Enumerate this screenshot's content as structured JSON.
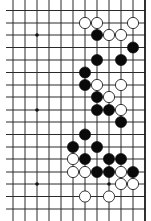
{
  "board": {
    "title": "Go board fragment",
    "colors": {
      "background": "#ffffff",
      "line": "#2a2a2a",
      "edge": "#1a1a1a",
      "black_stone": "#0a0a0a",
      "white_stone_fill": "#ffffff",
      "white_stone_stroke": "#222222",
      "star_point": "#111111"
    },
    "grid": {
      "col_x": [
        13,
        25,
        37,
        49,
        61,
        73,
        85,
        97,
        109,
        121,
        133,
        145
      ],
      "row_y": [
        10.5,
        23,
        35,
        47.5,
        60,
        72.5,
        85,
        97,
        110,
        122,
        134.5,
        147,
        159,
        172,
        184,
        196.5,
        209
      ],
      "h_line_start_x": 6,
      "v_line_start_y": 0,
      "v_line_end_y": 221,
      "right_edge_col": 11
    },
    "stone_radius": 5.6,
    "star_points": [
      {
        "col": 2,
        "row": 2
      },
      {
        "col": 2,
        "row": 8
      },
      {
        "col": 2,
        "row": 14
      },
      {
        "col": 8,
        "row": 14
      }
    ],
    "stones": [
      {
        "color": "white",
        "col": 6,
        "row": 1
      },
      {
        "color": "white",
        "col": 7,
        "row": 1
      },
      {
        "color": "white",
        "col": 10,
        "row": 1
      },
      {
        "color": "black",
        "col": 7,
        "row": 2
      },
      {
        "color": "white",
        "col": 8,
        "row": 2
      },
      {
        "color": "white",
        "col": 9,
        "row": 2
      },
      {
        "color": "black",
        "col": 10,
        "row": 3
      },
      {
        "color": "black",
        "col": 7,
        "row": 4
      },
      {
        "color": "black",
        "col": 9,
        "row": 4
      },
      {
        "color": "black",
        "col": 6,
        "row": 5
      },
      {
        "color": "black",
        "col": 6,
        "row": 6
      },
      {
        "color": "white",
        "col": 7,
        "row": 6
      },
      {
        "color": "white",
        "col": 9,
        "row": 6
      },
      {
        "color": "black",
        "col": 7,
        "row": 7
      },
      {
        "color": "white",
        "col": 8,
        "row": 7
      },
      {
        "color": "black",
        "col": 7,
        "row": 8
      },
      {
        "color": "black",
        "col": 8,
        "row": 8
      },
      {
        "color": "white",
        "col": 9,
        "row": 8
      },
      {
        "color": "black",
        "col": 9,
        "row": 9
      },
      {
        "color": "black",
        "col": 6,
        "row": 10
      },
      {
        "color": "black",
        "col": 5,
        "row": 11
      },
      {
        "color": "black",
        "col": 7,
        "row": 11
      },
      {
        "color": "white",
        "col": 5,
        "row": 12
      },
      {
        "color": "black",
        "col": 6,
        "row": 12
      },
      {
        "color": "black",
        "col": 8,
        "row": 12
      },
      {
        "color": "black",
        "col": 9,
        "row": 12
      },
      {
        "color": "white",
        "col": 5,
        "row": 13
      },
      {
        "color": "white",
        "col": 6,
        "row": 13
      },
      {
        "color": "black",
        "col": 7,
        "row": 13
      },
      {
        "color": "black",
        "col": 8,
        "row": 13
      },
      {
        "color": "white",
        "col": 9,
        "row": 13
      },
      {
        "color": "black",
        "col": 10,
        "row": 13
      },
      {
        "color": "white",
        "col": 9,
        "row": 14
      },
      {
        "color": "white",
        "col": 10,
        "row": 14
      },
      {
        "color": "white",
        "col": 6,
        "row": 15
      },
      {
        "color": "white",
        "col": 8,
        "row": 15
      }
    ]
  }
}
